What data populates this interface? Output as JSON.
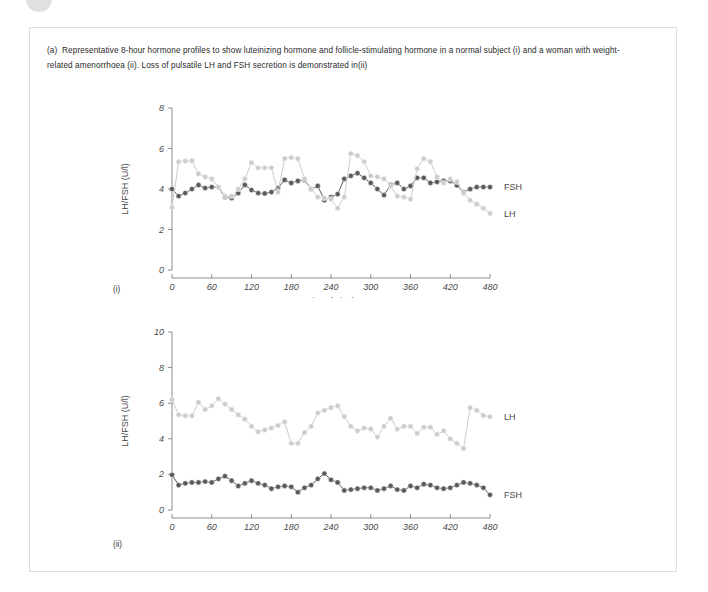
{
  "figure": {
    "caption_label": "(a)",
    "caption_text": "Representative 8-hour hormone profiles to show luteinizing hormone and follicle-stimulating hormone in a normal subject (i) and a woman with weight-related amenorrhoea (ii). Loss of pulsatile LH and FSH secretion is demonstrated in(ii)",
    "panel_one_tag": "(i)",
    "panel_two_tag": "(ii)",
    "colors": {
      "fsh": "#5a5a5a",
      "lh": "#cccccc",
      "axis": "#8c8c8c",
      "text": "#4a4a4a",
      "frame": "#dcdcdc"
    }
  },
  "chart_data": [
    {
      "id": "panel-i",
      "type": "line",
      "title": "",
      "xlabel": "Time (mins)",
      "ylabel": "LH/FSH (U/l)",
      "xlim": [
        0,
        480
      ],
      "ylim": [
        0,
        8
      ],
      "xticks": [
        0,
        60,
        120,
        180,
        240,
        300,
        360,
        420,
        480
      ],
      "yticks": [
        0,
        2,
        4,
        6,
        8
      ],
      "grid": false,
      "legend_position": "right-of-plot",
      "x": [
        0,
        10,
        20,
        30,
        40,
        50,
        60,
        70,
        80,
        90,
        100,
        110,
        120,
        130,
        140,
        150,
        160,
        170,
        180,
        190,
        200,
        210,
        220,
        230,
        240,
        250,
        260,
        270,
        280,
        290,
        300,
        310,
        320,
        330,
        340,
        350,
        360,
        370,
        380,
        390,
        400,
        410,
        420,
        430,
        440,
        450,
        460,
        470,
        480
      ],
      "series": [
        {
          "name": "FSH",
          "color": "#5a5a5a",
          "values": [
            4.0,
            3.65,
            3.8,
            4.0,
            4.2,
            4.05,
            4.1,
            4.1,
            3.6,
            3.55,
            3.8,
            4.2,
            3.95,
            3.8,
            3.78,
            3.85,
            4.05,
            4.45,
            4.3,
            4.4,
            4.45,
            4.0,
            4.15,
            3.45,
            3.6,
            3.75,
            4.5,
            4.65,
            4.78,
            4.55,
            4.3,
            4.0,
            3.7,
            4.2,
            4.3,
            4.0,
            4.15,
            4.55,
            4.55,
            4.3,
            4.35,
            4.4,
            4.4,
            4.18,
            3.85,
            4.0,
            4.1,
            4.1,
            4.1
          ]
        },
        {
          "name": "LH",
          "color": "#cccccc",
          "values": [
            3.1,
            5.35,
            5.38,
            5.4,
            4.75,
            4.6,
            4.5,
            4.1,
            3.65,
            3.65,
            4.0,
            4.5,
            5.3,
            5.05,
            5.05,
            5.05,
            3.85,
            5.5,
            5.55,
            5.5,
            4.5,
            4.0,
            3.6,
            3.55,
            3.5,
            3.05,
            3.6,
            5.75,
            5.65,
            5.35,
            4.65,
            4.6,
            4.5,
            4.15,
            3.65,
            3.6,
            3.5,
            5.0,
            5.5,
            5.35,
            4.6,
            4.3,
            4.5,
            4.35,
            3.8,
            3.45,
            3.25,
            3.05,
            2.8
          ]
        }
      ]
    },
    {
      "id": "panel-ii",
      "type": "line",
      "title": "",
      "xlabel": "Time (mins)",
      "ylabel": "LH/FSH (U/l)",
      "xlim": [
        0,
        480
      ],
      "ylim": [
        0,
        10
      ],
      "xticks": [
        0,
        60,
        120,
        180,
        240,
        300,
        360,
        420,
        480
      ],
      "yticks": [
        0,
        2,
        4,
        6,
        8,
        10
      ],
      "grid": false,
      "legend_position": "right-of-plot",
      "x": [
        0,
        10,
        20,
        30,
        40,
        50,
        60,
        70,
        80,
        90,
        100,
        110,
        120,
        130,
        140,
        150,
        160,
        170,
        180,
        190,
        200,
        210,
        220,
        230,
        240,
        250,
        260,
        270,
        280,
        290,
        300,
        310,
        320,
        330,
        340,
        350,
        360,
        370,
        380,
        390,
        400,
        410,
        420,
        430,
        440,
        450,
        460,
        470,
        480
      ],
      "series": [
        {
          "name": "LH",
          "color": "#cccccc",
          "values": [
            6.2,
            5.35,
            5.3,
            5.3,
            6.05,
            5.65,
            5.85,
            6.25,
            5.95,
            5.65,
            5.35,
            5.1,
            4.7,
            4.4,
            4.5,
            4.6,
            4.75,
            4.95,
            3.75,
            3.75,
            4.35,
            4.7,
            5.45,
            5.6,
            5.75,
            5.85,
            5.25,
            4.7,
            4.45,
            4.6,
            4.55,
            4.1,
            4.7,
            5.15,
            4.55,
            4.7,
            4.7,
            4.3,
            4.65,
            4.65,
            4.25,
            4.45,
            4.0,
            3.75,
            3.45,
            5.75,
            5.6,
            5.3,
            5.25
          ]
        },
        {
          "name": "FSH",
          "color": "#5a5a5a",
          "values": [
            1.98,
            1.4,
            1.5,
            1.55,
            1.55,
            1.6,
            1.55,
            1.75,
            1.9,
            1.65,
            1.35,
            1.5,
            1.65,
            1.5,
            1.4,
            1.2,
            1.3,
            1.35,
            1.3,
            1.0,
            1.25,
            1.4,
            1.75,
            2.05,
            1.7,
            1.55,
            1.1,
            1.15,
            1.2,
            1.25,
            1.25,
            1.1,
            1.2,
            1.35,
            1.15,
            1.1,
            1.35,
            1.25,
            1.45,
            1.4,
            1.25,
            1.2,
            1.25,
            1.4,
            1.55,
            1.5,
            1.4,
            1.25,
            0.85
          ]
        }
      ]
    }
  ]
}
